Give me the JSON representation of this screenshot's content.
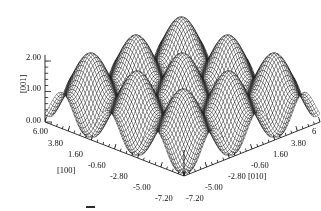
{
  "figure": {
    "kind": "surface-mesh-plot-3d",
    "background_color": "#ffffff",
    "mesh_color": "#111111",
    "axis_color": "#1a1a1a"
  },
  "axes": {
    "z": {
      "name": "[001]",
      "label": "[001]",
      "ticks": [
        "0.00",
        "1.00",
        "2.00"
      ],
      "tick_values": [
        0.0,
        1.0,
        2.0
      ],
      "range": [
        0.0,
        2.2
      ]
    },
    "x": {
      "name": "[100]",
      "label": "[100]",
      "ticks": [
        "6.00",
        "3.80",
        "1.60",
        "-0.60",
        "-2.80",
        "-5.00",
        "-7.20"
      ],
      "tick_values": [
        6.0,
        3.8,
        1.6,
        -0.6,
        -2.8,
        -5.0,
        -7.2
      ],
      "range": [
        -7.2,
        6.0
      ]
    },
    "y": {
      "name": "[010]",
      "label": "[010]",
      "ticks": [
        "-7.20",
        "-5.00",
        "-2.80",
        "-0.60",
        "1.60",
        "3.80",
        "6"
      ],
      "tick_values": [
        -7.2,
        -5.0,
        -2.8,
        -0.6,
        1.6,
        3.8,
        6.0
      ],
      "range": [
        -7.2,
        6.0
      ]
    }
  },
  "chart_data": {
    "type": "surface",
    "title": "",
    "subtitle": "",
    "xlabel": "[100]",
    "ylabel": "[010]",
    "zlabel": "[001]",
    "xlim": [
      -7.2,
      6.0
    ],
    "ylim": [
      -7.2,
      6.0
    ],
    "zlim": [
      0.0,
      2.2
    ],
    "grid": false,
    "legend": false,
    "legend_position": "none",
    "render_style": "wireframe-mesh",
    "mesh_samples": [
      72,
      72
    ],
    "surface_model": "z = 1 + 0.55*cos(2*pi*x/4.4) + 0.55*cos(2*pi*y/4.4) - 0.1",
    "period": 4.4,
    "peak_height": 2.1,
    "valley_height": 0.0,
    "mean_height": 1.0,
    "peak_count_x": 4,
    "peak_count_y": 4,
    "x_tick_labels": [
      "6.00",
      "3.80",
      "1.60",
      "-0.60",
      "-2.80",
      "-5.00",
      "-7.20"
    ],
    "y_tick_labels": [
      "-7.20",
      "-5.00",
      "-2.80",
      "-0.60",
      "1.60",
      "3.80",
      "6"
    ],
    "z_tick_labels": [
      "0.00",
      "1.00",
      "2.00"
    ],
    "z_tick_values": [
      0.0,
      1.0,
      2.0
    ]
  },
  "view": {
    "description": "default three-quarter view, front corner pointing toward the viewer",
    "azimuth_deg": 45,
    "elevation_deg": 28
  }
}
